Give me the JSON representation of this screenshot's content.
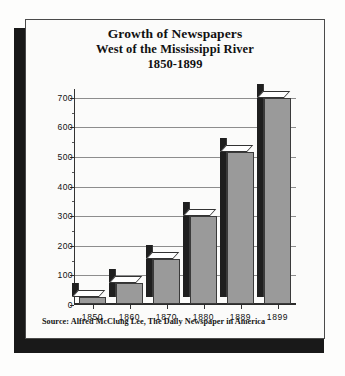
{
  "figure": {
    "title_lines": [
      "Growth of Newspapers",
      "West of the Mississippi River",
      "1850-1899"
    ],
    "source_note": "Source: Alfred McClung Lee, The Daily Newspaper in America",
    "colors": {
      "bar_front": "#9a9a9a",
      "bar_side": "#1f1f1f",
      "bar_top": "#ffffff",
      "gridline": "#8d8d8d",
      "axis": "#2b2b2b",
      "card_background": "#fbfbfa",
      "shadow": "#191919",
      "text": "#111111"
    }
  },
  "chart_data": {
    "type": "bar",
    "title": "Growth of Newspapers West of the Mississippi River 1850-1899",
    "subtitle": "1850-1899",
    "categories": [
      "1850",
      "1860",
      "1870",
      "1880",
      "1889",
      "1899"
    ],
    "values": [
      25,
      72,
      152,
      298,
      515,
      697
    ],
    "series": [
      {
        "name": "Newspapers west of the Mississippi River",
        "values": [
          25,
          72,
          152,
          298,
          515,
          697
        ]
      }
    ],
    "xlabel": "",
    "ylabel": "",
    "ylim": [
      0,
      730
    ],
    "yticks": [
      0,
      100,
      200,
      300,
      400,
      500,
      600,
      700
    ],
    "ytick_labels": [
      "0",
      "100",
      "200",
      "300",
      "400",
      "500",
      "600",
      "700"
    ],
    "yminor_ticks": [
      50,
      150,
      250,
      350,
      450,
      550,
      650
    ],
    "grid": true,
    "grid_axis": "y",
    "legend": false,
    "legend_position": "none",
    "style": "3d-bar",
    "annotations": [
      "Source: Alfred McClung Lee, The Daily Newspaper in America"
    ]
  }
}
